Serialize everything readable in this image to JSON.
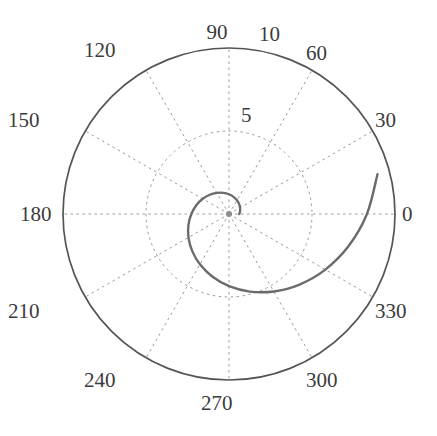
{
  "figure": {
    "name": "polar-plot",
    "background_color": "#ffffff",
    "width": 437,
    "height": 436
  },
  "chart_data": {
    "type": "line",
    "projection": "polar",
    "title": "",
    "xlabel": "",
    "ylabel": "",
    "grid": true,
    "legend": null,
    "center_px": [
      229,
      214
    ],
    "outer_radius_px": 166,
    "theta_direction": "counterclockwise",
    "theta_zero_location": "E",
    "theta_unit": "degrees",
    "theta_ticks": [
      0,
      30,
      60,
      90,
      120,
      150,
      180,
      210,
      240,
      270,
      300,
      330
    ],
    "theta_tick_labels": [
      "0",
      "30",
      "60",
      "90",
      "120",
      "150",
      "180",
      "210",
      "240",
      "270",
      "300",
      "330"
    ],
    "r_ticks": [
      5,
      10
    ],
    "r_tick_labels": [
      "5",
      "10"
    ],
    "rlim": [
      0,
      10
    ],
    "series": [
      {
        "name": "logarithmic-spiral",
        "color": "#6b6b6b",
        "line_width": 2.4,
        "style": "solid",
        "theta_deg": [
          0,
          15,
          30,
          45,
          60,
          75,
          90,
          105,
          120,
          135,
          150,
          165,
          180,
          195,
          210,
          225,
          240,
          255,
          270,
          285,
          300,
          315,
          330,
          345,
          360,
          375,
          390,
          405,
          420,
          435,
          450,
          465,
          480,
          495,
          510,
          525,
          540
        ],
        "r": [
          0.62,
          0.69,
          0.77,
          0.86,
          0.96,
          1.07,
          1.19,
          1.32,
          1.47,
          1.64,
          1.83,
          2.04,
          2.27,
          2.53,
          2.82,
          3.14,
          3.5,
          3.9,
          4.35,
          4.84,
          5.39,
          6.01,
          6.7,
          7.46,
          8.31,
          9.26,
          10.32,
          11.5,
          12.81,
          14.27,
          15.9,
          17.72,
          19.74,
          22.0,
          24.51,
          27.31,
          30.43
        ],
        "r_plotted_px": [
          10,
          11,
          13,
          14,
          16,
          18,
          20,
          22,
          24,
          27,
          30,
          34,
          38,
          42,
          47,
          52,
          58,
          65,
          72,
          80,
          89,
          100,
          111,
          124,
          138,
          153,
          166,
          166,
          166,
          166,
          166,
          166,
          166,
          166,
          166,
          166,
          166
        ],
        "description": "Spiral curve starting near the origin at 0 degrees and winding counterclockwise for about 1.5 turns, ending near r=6.4 at 180 degrees"
      }
    ]
  },
  "grid_style": {
    "outer_circle_color": "#555555",
    "outer_circle_width": 1.6,
    "grid_color": "#9a9a9a",
    "grid_dash": "2,3",
    "grid_width": 1
  },
  "labels": {
    "angular": [
      {
        "name": "theta-label-0",
        "text": "0",
        "x": 402,
        "y": 204,
        "anchor": "left"
      },
      {
        "name": "theta-label-30",
        "text": "30",
        "x": 375,
        "y": 110,
        "anchor": "left"
      },
      {
        "name": "theta-label-60",
        "text": "60",
        "x": 306,
        "y": 43,
        "anchor": "left"
      },
      {
        "name": "theta-label-90",
        "text": "90",
        "x": 217,
        "y": 22,
        "anchor": "center"
      },
      {
        "name": "theta-label-120",
        "text": "120",
        "x": 116,
        "y": 40,
        "anchor": "right"
      },
      {
        "name": "theta-label-150",
        "text": "150",
        "x": 40,
        "y": 110,
        "anchor": "right"
      },
      {
        "name": "theta-label-180",
        "text": "180",
        "x": 20,
        "y": 204,
        "anchor": "left"
      },
      {
        "name": "theta-label-210",
        "text": "210",
        "x": 40,
        "y": 301,
        "anchor": "right"
      },
      {
        "name": "theta-label-240",
        "text": "240",
        "x": 116,
        "y": 370,
        "anchor": "right"
      },
      {
        "name": "theta-label-270",
        "text": "270",
        "x": 217,
        "y": 393,
        "anchor": "center"
      },
      {
        "name": "theta-label-300",
        "text": "300",
        "x": 306,
        "y": 370,
        "anchor": "left"
      },
      {
        "name": "theta-label-330",
        "text": "330",
        "x": 375,
        "y": 301,
        "anchor": "left"
      }
    ],
    "radial": [
      {
        "name": "r-label-5",
        "text": "5",
        "x": 241,
        "y": 105,
        "anchor": "left"
      },
      {
        "name": "r-label-10",
        "text": "10",
        "x": 259,
        "y": 24,
        "anchor": "left"
      }
    ]
  }
}
